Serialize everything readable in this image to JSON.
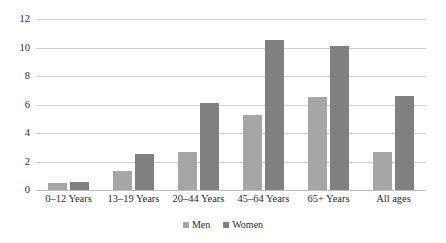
{
  "chart_data": {
    "type": "bar",
    "title": "",
    "subtitle": "",
    "xlabel": "",
    "ylabel": "",
    "ylim": [
      0,
      12
    ],
    "yticks": [
      0,
      2,
      4,
      6,
      8,
      10,
      12
    ],
    "grid": true,
    "legend_position": "bottom",
    "categories": [
      "0–12 Years",
      "13–19 Years",
      "20–44 Years",
      "45–64 Years",
      "65+ Years",
      "All ages"
    ],
    "series": [
      {
        "name": "Men",
        "color": "#a6a6a6",
        "values": [
          0.5,
          1.3,
          2.65,
          5.25,
          6.5,
          2.7
        ]
      },
      {
        "name": "Women",
        "color": "#808080",
        "values": [
          0.55,
          2.5,
          6.1,
          10.5,
          10.1,
          6.6
        ]
      }
    ]
  },
  "colors": {
    "men": "#a6a6a6",
    "women": "#808080",
    "gridline": "#cfcfcf",
    "axis": "#bdbdbd",
    "text": "#2b2b2b",
    "background": "#ffffff"
  }
}
